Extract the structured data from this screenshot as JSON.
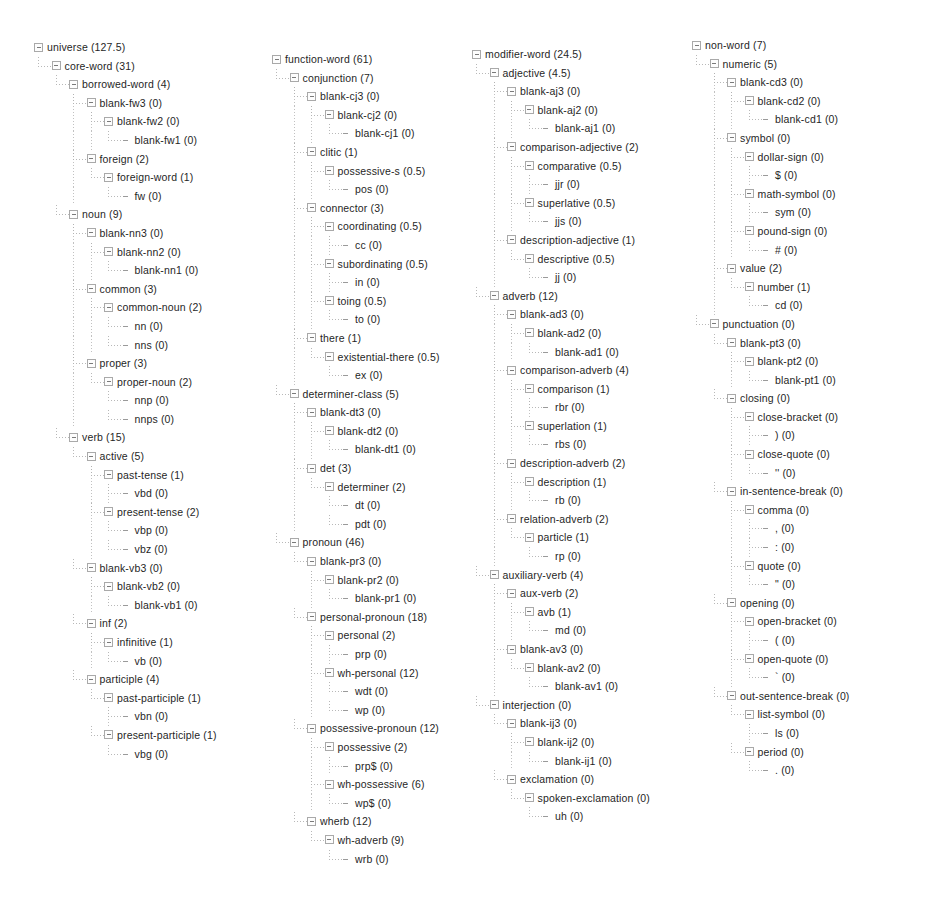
{
  "app": {
    "view_name": "taxonomy-tree",
    "title": "universe taxonomy tree"
  },
  "icons": {
    "expander": "expand-collapse-box-icon",
    "leaf": "leaf-connector-icon"
  },
  "colors": {
    "text": "#1f1f1f",
    "guide_line": "#b0b0b0",
    "expander_border": "#a9a9a9",
    "background": "#ffffff"
  },
  "columns": [
    {
      "id": "core-word-column",
      "nodes": [
        {
          "depth": 0,
          "label": "universe (127.5)",
          "expandable": true
        },
        {
          "depth": 1,
          "label": "core-word (31)",
          "expandable": true
        },
        {
          "depth": 2,
          "label": "borrowed-word (4)",
          "expandable": true
        },
        {
          "depth": 3,
          "label": "blank-fw3 (0)",
          "expandable": true
        },
        {
          "depth": 4,
          "label": "blank-fw2 (0)",
          "expandable": true
        },
        {
          "depth": 5,
          "label": "blank-fw1 (0)",
          "expandable": false
        },
        {
          "depth": 3,
          "label": "foreign (2)",
          "expandable": true
        },
        {
          "depth": 4,
          "label": "foreign-word (1)",
          "expandable": true
        },
        {
          "depth": 5,
          "label": "fw (0)",
          "expandable": false
        },
        {
          "depth": 2,
          "label": "noun (9)",
          "expandable": true
        },
        {
          "depth": 3,
          "label": "blank-nn3 (0)",
          "expandable": true
        },
        {
          "depth": 4,
          "label": "blank-nn2 (0)",
          "expandable": true
        },
        {
          "depth": 5,
          "label": "blank-nn1 (0)",
          "expandable": false
        },
        {
          "depth": 3,
          "label": "common (3)",
          "expandable": true
        },
        {
          "depth": 4,
          "label": "common-noun (2)",
          "expandable": true
        },
        {
          "depth": 5,
          "label": "nn (0)",
          "expandable": false
        },
        {
          "depth": 5,
          "label": "nns (0)",
          "expandable": false
        },
        {
          "depth": 3,
          "label": "proper (3)",
          "expandable": true
        },
        {
          "depth": 4,
          "label": "proper-noun (2)",
          "expandable": true
        },
        {
          "depth": 5,
          "label": "nnp (0)",
          "expandable": false
        },
        {
          "depth": 5,
          "label": "nnps (0)",
          "expandable": false
        },
        {
          "depth": 2,
          "label": "verb (15)",
          "expandable": true
        },
        {
          "depth": 3,
          "label": "active (5)",
          "expandable": true
        },
        {
          "depth": 4,
          "label": "past-tense (1)",
          "expandable": true
        },
        {
          "depth": 5,
          "label": "vbd (0)",
          "expandable": false
        },
        {
          "depth": 4,
          "label": "present-tense (2)",
          "expandable": true
        },
        {
          "depth": 5,
          "label": "vbp (0)",
          "expandable": false
        },
        {
          "depth": 5,
          "label": "vbz (0)",
          "expandable": false
        },
        {
          "depth": 3,
          "label": "blank-vb3 (0)",
          "expandable": true
        },
        {
          "depth": 4,
          "label": "blank-vb2 (0)",
          "expandable": true
        },
        {
          "depth": 5,
          "label": "blank-vb1 (0)",
          "expandable": false
        },
        {
          "depth": 3,
          "label": "inf (2)",
          "expandable": true
        },
        {
          "depth": 4,
          "label": "infinitive (1)",
          "expandable": true
        },
        {
          "depth": 5,
          "label": "vb (0)",
          "expandable": false
        },
        {
          "depth": 3,
          "label": "participle (4)",
          "expandable": true
        },
        {
          "depth": 4,
          "label": "past-participle (1)",
          "expandable": true
        },
        {
          "depth": 5,
          "label": "vbn (0)",
          "expandable": false
        },
        {
          "depth": 4,
          "label": "present-participle (1)",
          "expandable": true
        },
        {
          "depth": 5,
          "label": "vbg (0)",
          "expandable": false
        }
      ]
    },
    {
      "id": "function-word-column",
      "nodes": [
        {
          "depth": 0,
          "label": "function-word (61)",
          "expandable": true
        },
        {
          "depth": 1,
          "label": "conjunction (7)",
          "expandable": true
        },
        {
          "depth": 2,
          "label": "blank-cj3 (0)",
          "expandable": true
        },
        {
          "depth": 3,
          "label": "blank-cj2 (0)",
          "expandable": true
        },
        {
          "depth": 4,
          "label": "blank-cj1 (0)",
          "expandable": false
        },
        {
          "depth": 2,
          "label": "clitic (1)",
          "expandable": true
        },
        {
          "depth": 3,
          "label": "possessive-s (0.5)",
          "expandable": true
        },
        {
          "depth": 4,
          "label": "pos (0)",
          "expandable": false
        },
        {
          "depth": 2,
          "label": "connector (3)",
          "expandable": true
        },
        {
          "depth": 3,
          "label": "coordinating (0.5)",
          "expandable": true
        },
        {
          "depth": 4,
          "label": "cc (0)",
          "expandable": false
        },
        {
          "depth": 3,
          "label": "subordinating (0.5)",
          "expandable": true
        },
        {
          "depth": 4,
          "label": "in (0)",
          "expandable": false
        },
        {
          "depth": 3,
          "label": "toing (0.5)",
          "expandable": true
        },
        {
          "depth": 4,
          "label": "to (0)",
          "expandable": false
        },
        {
          "depth": 2,
          "label": "there (1)",
          "expandable": true
        },
        {
          "depth": 3,
          "label": "existential-there (0.5)",
          "expandable": true
        },
        {
          "depth": 4,
          "label": "ex (0)",
          "expandable": false
        },
        {
          "depth": 1,
          "label": "determiner-class (5)",
          "expandable": true
        },
        {
          "depth": 2,
          "label": "blank-dt3 (0)",
          "expandable": true
        },
        {
          "depth": 3,
          "label": "blank-dt2 (0)",
          "expandable": true
        },
        {
          "depth": 4,
          "label": "blank-dt1 (0)",
          "expandable": false
        },
        {
          "depth": 2,
          "label": "det (3)",
          "expandable": true
        },
        {
          "depth": 3,
          "label": "determiner (2)",
          "expandable": true
        },
        {
          "depth": 4,
          "label": "dt (0)",
          "expandable": false
        },
        {
          "depth": 4,
          "label": "pdt (0)",
          "expandable": false
        },
        {
          "depth": 1,
          "label": "pronoun (46)",
          "expandable": true
        },
        {
          "depth": 2,
          "label": "blank-pr3 (0)",
          "expandable": true
        },
        {
          "depth": 3,
          "label": "blank-pr2 (0)",
          "expandable": true
        },
        {
          "depth": 4,
          "label": "blank-pr1 (0)",
          "expandable": false
        },
        {
          "depth": 2,
          "label": "personal-pronoun (18)",
          "expandable": true
        },
        {
          "depth": 3,
          "label": "personal (2)",
          "expandable": true
        },
        {
          "depth": 4,
          "label": "prp (0)",
          "expandable": false
        },
        {
          "depth": 3,
          "label": "wh-personal (12)",
          "expandable": true
        },
        {
          "depth": 4,
          "label": "wdt (0)",
          "expandable": false
        },
        {
          "depth": 4,
          "label": "wp (0)",
          "expandable": false
        },
        {
          "depth": 2,
          "label": "possessive-pronoun (12)",
          "expandable": true
        },
        {
          "depth": 3,
          "label": "possessive (2)",
          "expandable": true
        },
        {
          "depth": 4,
          "label": "prp$ (0)",
          "expandable": false
        },
        {
          "depth": 3,
          "label": "wh-possessive (6)",
          "expandable": true
        },
        {
          "depth": 4,
          "label": "wp$ (0)",
          "expandable": false
        },
        {
          "depth": 2,
          "label": "wherb (12)",
          "expandable": true
        },
        {
          "depth": 3,
          "label": "wh-adverb (9)",
          "expandable": true
        },
        {
          "depth": 4,
          "label": "wrb (0)",
          "expandable": false
        }
      ]
    },
    {
      "id": "modifier-word-column",
      "nodes": [
        {
          "depth": 0,
          "label": "modifier-word (24.5)",
          "expandable": true
        },
        {
          "depth": 1,
          "label": "adjective (4.5)",
          "expandable": true
        },
        {
          "depth": 2,
          "label": "blank-aj3 (0)",
          "expandable": true
        },
        {
          "depth": 3,
          "label": "blank-aj2 (0)",
          "expandable": true
        },
        {
          "depth": 4,
          "label": "blank-aj1 (0)",
          "expandable": false
        },
        {
          "depth": 2,
          "label": "comparison-adjective (2)",
          "expandable": true
        },
        {
          "depth": 3,
          "label": "comparative (0.5)",
          "expandable": true
        },
        {
          "depth": 4,
          "label": "jjr (0)",
          "expandable": false
        },
        {
          "depth": 3,
          "label": "superlative (0.5)",
          "expandable": true
        },
        {
          "depth": 4,
          "label": "jjs (0)",
          "expandable": false
        },
        {
          "depth": 2,
          "label": "description-adjective (1)",
          "expandable": true
        },
        {
          "depth": 3,
          "label": "descriptive (0.5)",
          "expandable": true
        },
        {
          "depth": 4,
          "label": "jj (0)",
          "expandable": false
        },
        {
          "depth": 1,
          "label": "adverb (12)",
          "expandable": true
        },
        {
          "depth": 2,
          "label": "blank-ad3 (0)",
          "expandable": true
        },
        {
          "depth": 3,
          "label": "blank-ad2 (0)",
          "expandable": true
        },
        {
          "depth": 4,
          "label": "blank-ad1 (0)",
          "expandable": false
        },
        {
          "depth": 2,
          "label": "comparison-adverb (4)",
          "expandable": true
        },
        {
          "depth": 3,
          "label": "comparison (1)",
          "expandable": true
        },
        {
          "depth": 4,
          "label": "rbr (0)",
          "expandable": false
        },
        {
          "depth": 3,
          "label": "superlation (1)",
          "expandable": true
        },
        {
          "depth": 4,
          "label": "rbs (0)",
          "expandable": false
        },
        {
          "depth": 2,
          "label": "description-adverb (2)",
          "expandable": true
        },
        {
          "depth": 3,
          "label": "description (1)",
          "expandable": true
        },
        {
          "depth": 4,
          "label": "rb (0)",
          "expandable": false
        },
        {
          "depth": 2,
          "label": "relation-adverb (2)",
          "expandable": true
        },
        {
          "depth": 3,
          "label": "particle (1)",
          "expandable": true
        },
        {
          "depth": 4,
          "label": "rp (0)",
          "expandable": false
        },
        {
          "depth": 1,
          "label": "auxiliary-verb (4)",
          "expandable": true
        },
        {
          "depth": 2,
          "label": "aux-verb (2)",
          "expandable": true
        },
        {
          "depth": 3,
          "label": "avb (1)",
          "expandable": true
        },
        {
          "depth": 4,
          "label": "md (0)",
          "expandable": false
        },
        {
          "depth": 2,
          "label": "blank-av3 (0)",
          "expandable": true
        },
        {
          "depth": 3,
          "label": "blank-av2 (0)",
          "expandable": true
        },
        {
          "depth": 4,
          "label": "blank-av1 (0)",
          "expandable": false
        },
        {
          "depth": 1,
          "label": "interjection (0)",
          "expandable": true
        },
        {
          "depth": 2,
          "label": "blank-ij3 (0)",
          "expandable": true
        },
        {
          "depth": 3,
          "label": "blank-ij2 (0)",
          "expandable": true
        },
        {
          "depth": 4,
          "label": "blank-ij1 (0)",
          "expandable": false
        },
        {
          "depth": 2,
          "label": "exclamation (0)",
          "expandable": true
        },
        {
          "depth": 3,
          "label": "spoken-exclamation (0)",
          "expandable": true
        },
        {
          "depth": 4,
          "label": "uh (0)",
          "expandable": false
        }
      ]
    },
    {
      "id": "non-word-column",
      "nodes": [
        {
          "depth": 0,
          "label": "non-word (7)",
          "expandable": true
        },
        {
          "depth": 1,
          "label": "numeric (5)",
          "expandable": true
        },
        {
          "depth": 2,
          "label": "blank-cd3 (0)",
          "expandable": true
        },
        {
          "depth": 3,
          "label": "blank-cd2 (0)",
          "expandable": true
        },
        {
          "depth": 4,
          "label": "blank-cd1 (0)",
          "expandable": false
        },
        {
          "depth": 2,
          "label": "symbol (0)",
          "expandable": true
        },
        {
          "depth": 3,
          "label": "dollar-sign (0)",
          "expandable": true
        },
        {
          "depth": 4,
          "label": "$ (0)",
          "expandable": false
        },
        {
          "depth": 3,
          "label": "math-symbol (0)",
          "expandable": true
        },
        {
          "depth": 4,
          "label": "sym (0)",
          "expandable": false
        },
        {
          "depth": 3,
          "label": "pound-sign (0)",
          "expandable": true
        },
        {
          "depth": 4,
          "label": "# (0)",
          "expandable": false
        },
        {
          "depth": 2,
          "label": "value (2)",
          "expandable": true
        },
        {
          "depth": 3,
          "label": "number (1)",
          "expandable": true
        },
        {
          "depth": 4,
          "label": "cd (0)",
          "expandable": false
        },
        {
          "depth": 1,
          "label": "punctuation (0)",
          "expandable": true
        },
        {
          "depth": 2,
          "label": "blank-pt3 (0)",
          "expandable": true
        },
        {
          "depth": 3,
          "label": "blank-pt2 (0)",
          "expandable": true
        },
        {
          "depth": 4,
          "label": "blank-pt1 (0)",
          "expandable": false
        },
        {
          "depth": 2,
          "label": "closing (0)",
          "expandable": true
        },
        {
          "depth": 3,
          "label": "close-bracket (0)",
          "expandable": true
        },
        {
          "depth": 4,
          "label": ") (0)",
          "expandable": false
        },
        {
          "depth": 3,
          "label": "close-quote (0)",
          "expandable": true
        },
        {
          "depth": 4,
          "label": "'' (0)",
          "expandable": false
        },
        {
          "depth": 2,
          "label": "in-sentence-break (0)",
          "expandable": true
        },
        {
          "depth": 3,
          "label": "comma (0)",
          "expandable": true
        },
        {
          "depth": 4,
          "label": ", (0)",
          "expandable": false
        },
        {
          "depth": 4,
          "label": ": (0)",
          "expandable": false
        },
        {
          "depth": 3,
          "label": "quote (0)",
          "expandable": true
        },
        {
          "depth": 4,
          "label": "\" (0)",
          "expandable": false
        },
        {
          "depth": 2,
          "label": "opening (0)",
          "expandable": true
        },
        {
          "depth": 3,
          "label": "open-bracket (0)",
          "expandable": true
        },
        {
          "depth": 4,
          "label": "( (0)",
          "expandable": false
        },
        {
          "depth": 3,
          "label": "open-quote (0)",
          "expandable": true
        },
        {
          "depth": 4,
          "label": "` (0)",
          "expandable": false
        },
        {
          "depth": 2,
          "label": "out-sentence-break (0)",
          "expandable": true
        },
        {
          "depth": 3,
          "label": "list-symbol (0)",
          "expandable": true
        },
        {
          "depth": 4,
          "label": "ls (0)",
          "expandable": false
        },
        {
          "depth": 3,
          "label": "period (0)",
          "expandable": true
        },
        {
          "depth": 4,
          "label": ". (0)",
          "expandable": false
        }
      ]
    }
  ]
}
